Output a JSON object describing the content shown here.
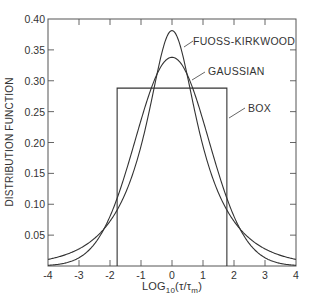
{
  "chart_data": {
    "type": "line",
    "title": "",
    "xlabel": "LOG10(τ/τm)",
    "xlabel_parts": {
      "main": "LOG",
      "sub": "10",
      "rest": "(τ/τ",
      "sub2": "m",
      "close": ")"
    },
    "ylabel": "DISTRIBUTION FUNCTION",
    "xlim": [
      -4,
      4
    ],
    "ylim": [
      0,
      0.4
    ],
    "grid": false,
    "x_ticks": [
      -4,
      -3,
      -2,
      -1,
      0,
      1,
      2,
      3,
      4
    ],
    "x_tick_labels": [
      "-4",
      "-3",
      "-2",
      "-1",
      "0",
      "1",
      "2",
      "3",
      "4"
    ],
    "y_ticks": [
      0.05,
      0.1,
      0.15,
      0.2,
      0.25,
      0.3,
      0.35,
      0.4
    ],
    "y_tick_labels": [
      "0.05",
      "0.10",
      "0.15",
      "0.20",
      "0.25",
      "0.30",
      "0.35",
      "0.40"
    ],
    "series": [
      {
        "name": "FUOSS-KIRKWOOD",
        "x": [
          -4,
          -3,
          -2,
          -1.5,
          -1,
          -0.5,
          0,
          0.5,
          1,
          1.5,
          2,
          3,
          4
        ],
        "values": [
          0.011,
          0.028,
          0.068,
          0.108,
          0.17,
          0.276,
          0.38,
          0.276,
          0.17,
          0.108,
          0.068,
          0.028,
          0.011
        ],
        "params": {
          "m": 0.414
        }
      },
      {
        "name": "GAUSSIAN",
        "x": [
          -4,
          -3,
          -2,
          -1.5,
          -1,
          -0.5,
          0,
          0.5,
          1,
          1.5,
          2,
          3,
          4
        ],
        "values": [
          0.001,
          0.013,
          0.08,
          0.15,
          0.236,
          0.31,
          0.338,
          0.31,
          0.236,
          0.15,
          0.08,
          0.013,
          0.001
        ],
        "params": {
          "peak": 0.338,
          "sigma": 1.18
        }
      },
      {
        "name": "BOX",
        "x": [
          -1.77,
          -1.77,
          1.77,
          1.77
        ],
        "values": [
          0,
          0.288,
          0.288,
          0
        ]
      }
    ],
    "annotations": [
      {
        "text": "FUOSS-KIRKWOOD",
        "points_to": [
          0.35,
          0.33
        ]
      },
      {
        "text": "GAUSSIAN",
        "points_to": [
          0.65,
          0.28
        ]
      },
      {
        "text": "BOX",
        "points_to": [
          1.77,
          0.255
        ]
      }
    ],
    "legend": "none (inline annotations)"
  }
}
